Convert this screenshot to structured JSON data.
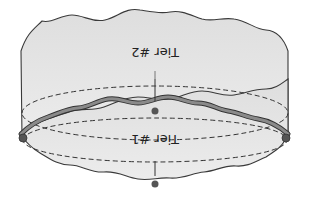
{
  "diagram": {
    "orientation": "rotated-180",
    "tiers": [
      {
        "id": "tier-1",
        "label": "Tier #1"
      },
      {
        "id": "tier-2",
        "label": "Tier #2"
      }
    ],
    "colors": {
      "fill": "#e6e6e6",
      "outline": "#3a3a3a",
      "seam_band": "#8a8a8a",
      "seam_edge": "#333333",
      "dashed": "#333333",
      "dot": "#555555"
    }
  }
}
